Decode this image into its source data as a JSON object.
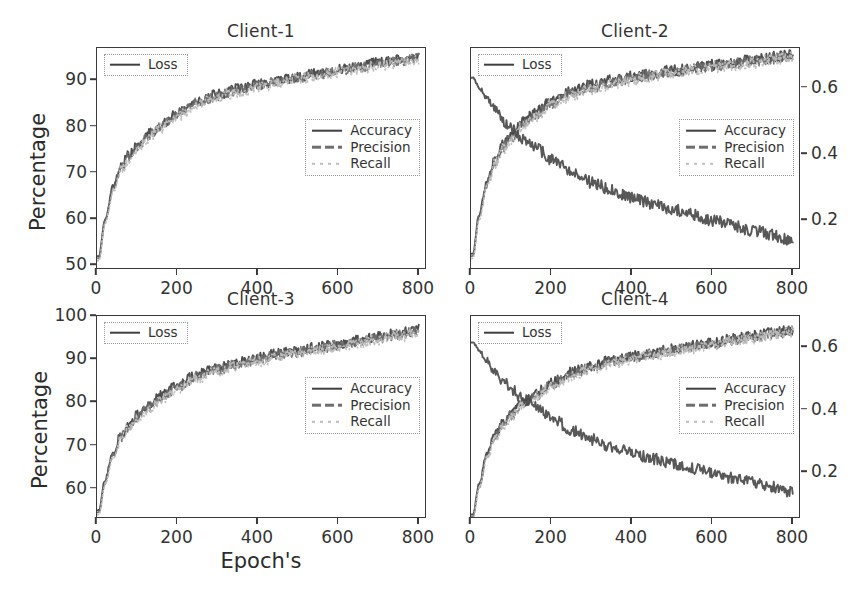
{
  "figure": {
    "xlabel": "Epoch's",
    "ylabel": "Percentage",
    "legend_loss_label": "Loss"
  },
  "legend": {
    "accuracy": "Accuracy",
    "precision": "Precision",
    "recall": "Recall",
    "loss": "Loss"
  },
  "colors": {
    "accuracy": "#3f3f3f",
    "precision": "#6e6e6e",
    "recall": "#bdbdbd",
    "loss": "#4a4a4a",
    "axis": "#3a3a3a",
    "text": "#2b2b2b",
    "background": "#ffffff"
  },
  "chart_data": [
    {
      "type": "line",
      "title": "Client-1",
      "xlabel": "Epoch's",
      "ylabel": "Percentage",
      "xlim": [
        0,
        820
      ],
      "ylim": [
        49,
        97
      ],
      "xticks": [
        0,
        200,
        400,
        600,
        800
      ],
      "yticks": [
        50,
        60,
        70,
        80,
        90
      ],
      "ylim_right": [
        0.05,
        0.72
      ],
      "yticks_right": [],
      "grid": false,
      "legend_position": "center-right",
      "series": [
        {
          "name": "Accuracy",
          "style": "solid",
          "color": "#3f3f3f",
          "x": [
            5,
            20,
            40,
            60,
            80,
            100,
            130,
            160,
            200,
            250,
            300,
            350,
            400,
            450,
            500,
            550,
            600,
            650,
            700,
            750,
            800
          ],
          "values": [
            52,
            60,
            67,
            71.5,
            74,
            76,
            78.5,
            80.5,
            83,
            85.5,
            87,
            88.2,
            89.2,
            90,
            90.8,
            91.6,
            92.4,
            93.1,
            93.8,
            94.5,
            95.2
          ],
          "noise": 1.1
        },
        {
          "name": "Precision",
          "style": "dashed",
          "color": "#6e6e6e",
          "x": [
            5,
            20,
            40,
            60,
            80,
            100,
            130,
            160,
            200,
            250,
            300,
            350,
            400,
            450,
            500,
            550,
            600,
            650,
            700,
            750,
            800
          ],
          "values": [
            51.5,
            59.5,
            66.5,
            71,
            73.6,
            75.6,
            78.1,
            80.1,
            82.6,
            85.1,
            86.6,
            87.9,
            88.9,
            89.7,
            90.5,
            91.3,
            92.1,
            92.8,
            93.5,
            94.2,
            94.9
          ],
          "noise": 1.1
        },
        {
          "name": "Recall",
          "style": "dotted",
          "color": "#bdbdbd",
          "x": [
            5,
            20,
            40,
            60,
            80,
            100,
            130,
            160,
            200,
            250,
            300,
            350,
            400,
            450,
            500,
            550,
            600,
            650,
            700,
            750,
            800
          ],
          "values": [
            51,
            59,
            66,
            70.5,
            73.2,
            75.2,
            77.7,
            79.7,
            82.2,
            84.7,
            86.2,
            87.5,
            88.5,
            89.4,
            90.2,
            91.0,
            91.8,
            92.5,
            93.2,
            93.9,
            94.6
          ],
          "noise": 1.2
        },
        {
          "name": "Loss",
          "style": "solid",
          "color": "#4a4a4a",
          "axis": "right",
          "x": [
            5,
            20,
            40,
            60,
            80,
            100,
            130,
            160,
            200,
            250,
            300,
            350,
            400,
            450,
            500,
            550,
            600,
            650,
            700,
            750,
            800
          ],
          "values": [
            92,
            90.5,
            88,
            85.5,
            83.5,
            81.5,
            79.5,
            78,
            75.5,
            72.5,
            70,
            67.5,
            65.5,
            63.5,
            62,
            60.5,
            59,
            57.5,
            56,
            54.5,
            52.5
          ],
          "noise": 1.3
        }
      ]
    },
    {
      "type": "line",
      "title": "Client-2",
      "xlabel": "Epoch's",
      "ylabel": "",
      "xlim": [
        0,
        820
      ],
      "ylim": [
        49,
        97
      ],
      "xticks": [
        0,
        200,
        400,
        600,
        800
      ],
      "yticks": [],
      "ylim_right": [
        0.05,
        0.72
      ],
      "yticks_right": [
        0.2,
        0.4,
        0.6
      ],
      "grid": false,
      "legend_position": "center-right",
      "series": [
        {
          "name": "Accuracy",
          "style": "solid",
          "color": "#3f3f3f",
          "x": [
            5,
            20,
            40,
            60,
            80,
            100,
            130,
            160,
            200,
            250,
            300,
            350,
            400,
            450,
            500,
            550,
            600,
            650,
            700,
            750,
            800
          ],
          "values": [
            52.5,
            61,
            68,
            73,
            76,
            78,
            81,
            83,
            85.5,
            87.5,
            89,
            90,
            90.8,
            91.5,
            92.1,
            92.7,
            93.3,
            93.9,
            94.4,
            95,
            95.6
          ],
          "noise": 1.2
        },
        {
          "name": "Precision",
          "style": "dashed",
          "color": "#6e6e6e",
          "x": [
            5,
            20,
            40,
            60,
            80,
            100,
            130,
            160,
            200,
            250,
            300,
            350,
            400,
            450,
            500,
            550,
            600,
            650,
            700,
            750,
            800
          ],
          "values": [
            52,
            60.5,
            67.5,
            72.5,
            75.6,
            77.6,
            80.6,
            82.6,
            85.1,
            87.1,
            88.6,
            89.6,
            90.5,
            91.2,
            91.8,
            92.4,
            93.0,
            93.6,
            94.1,
            94.7,
            95.3
          ],
          "noise": 1.2
        },
        {
          "name": "Recall",
          "style": "dotted",
          "color": "#bdbdbd",
          "x": [
            5,
            20,
            40,
            60,
            80,
            100,
            130,
            160,
            200,
            250,
            300,
            350,
            400,
            450,
            500,
            550,
            600,
            650,
            700,
            750,
            800
          ],
          "values": [
            51.5,
            60,
            67,
            72,
            75.2,
            77.2,
            80.2,
            82.2,
            84.7,
            86.7,
            88.2,
            89.2,
            90.1,
            90.9,
            91.5,
            92.1,
            92.7,
            93.3,
            93.8,
            94.4,
            95.0
          ],
          "noise": 1.3
        },
        {
          "name": "Loss",
          "style": "solid",
          "color": "#4a4a4a",
          "axis": "right",
          "x": [
            5,
            20,
            40,
            60,
            80,
            100,
            130,
            160,
            200,
            250,
            300,
            350,
            400,
            450,
            500,
            550,
            600,
            650,
            700,
            750,
            800
          ],
          "values": [
            0.63,
            0.6,
            0.565,
            0.53,
            0.5,
            0.475,
            0.445,
            0.42,
            0.385,
            0.345,
            0.315,
            0.29,
            0.27,
            0.25,
            0.235,
            0.218,
            0.2,
            0.185,
            0.17,
            0.155,
            0.14
          ],
          "noise": 0.018
        }
      ]
    },
    {
      "type": "line",
      "title": "Client-3",
      "xlabel": "Epoch's",
      "ylabel": "Percentage",
      "xlim": [
        0,
        820
      ],
      "ylim": [
        53,
        100
      ],
      "xticks": [
        0,
        200,
        400,
        600,
        800
      ],
      "yticks": [
        60,
        70,
        80,
        90,
        100
      ],
      "ylim_right": [
        0.05,
        0.72
      ],
      "yticks_right": [],
      "grid": false,
      "legend_position": "center-right",
      "series": [
        {
          "name": "Accuracy",
          "style": "solid",
          "color": "#3f3f3f",
          "x": [
            5,
            20,
            40,
            60,
            80,
            100,
            130,
            160,
            200,
            250,
            300,
            350,
            400,
            450,
            500,
            550,
            600,
            650,
            700,
            750,
            800
          ],
          "values": [
            55,
            62,
            68.5,
            72.5,
            75,
            77,
            79.5,
            81.5,
            84,
            86.5,
            88,
            89.2,
            90.3,
            91.2,
            92,
            92.8,
            93.6,
            94.4,
            95.2,
            96,
            96.8
          ],
          "noise": 1.2
        },
        {
          "name": "Precision",
          "style": "dashed",
          "color": "#6e6e6e",
          "x": [
            5,
            20,
            40,
            60,
            80,
            100,
            130,
            160,
            200,
            250,
            300,
            350,
            400,
            450,
            500,
            550,
            600,
            650,
            700,
            750,
            800
          ],
          "values": [
            54.5,
            61.5,
            68,
            72,
            74.6,
            76.6,
            79.1,
            81.1,
            83.6,
            86.1,
            87.6,
            88.9,
            90.0,
            90.9,
            91.7,
            92.5,
            93.3,
            94.1,
            94.9,
            95.7,
            96.5
          ],
          "noise": 1.2
        },
        {
          "name": "Recall",
          "style": "dotted",
          "color": "#bdbdbd",
          "x": [
            5,
            20,
            40,
            60,
            80,
            100,
            130,
            160,
            200,
            250,
            300,
            350,
            400,
            450,
            500,
            550,
            600,
            650,
            700,
            750,
            800
          ],
          "values": [
            54,
            61,
            67.5,
            71.5,
            74.2,
            76.2,
            78.7,
            80.7,
            83.2,
            85.7,
            87.2,
            88.5,
            89.6,
            90.5,
            91.3,
            92.1,
            92.9,
            93.7,
            94.5,
            95.3,
            96.1
          ],
          "noise": 1.3
        },
        {
          "name": "Loss",
          "style": "solid",
          "color": "#4a4a4a",
          "axis": "right",
          "x": [
            5,
            20,
            40,
            60,
            80,
            100,
            130,
            160,
            200,
            250,
            300,
            350,
            400,
            450,
            500,
            550,
            600,
            650,
            700,
            750,
            800
          ],
          "values": [
            94.5,
            92.5,
            90,
            87.5,
            85.5,
            83.5,
            81,
            79,
            76.5,
            73.5,
            71,
            68.5,
            66.5,
            64.5,
            62.5,
            61,
            59.5,
            58,
            56.5,
            55,
            53.5
          ],
          "noise": 1.4
        }
      ]
    },
    {
      "type": "line",
      "title": "Client-4",
      "xlabel": "Epoch's",
      "ylabel": "",
      "xlim": [
        0,
        820
      ],
      "ylim": [
        53,
        100
      ],
      "xticks": [
        0,
        200,
        400,
        600,
        800
      ],
      "yticks": [],
      "ylim_right": [
        0.05,
        0.7
      ],
      "yticks_right": [
        0.2,
        0.4,
        0.6
      ],
      "grid": false,
      "legend_position": "center-right",
      "series": [
        {
          "name": "Accuracy",
          "style": "solid",
          "color": "#3f3f3f",
          "x": [
            5,
            20,
            40,
            60,
            80,
            100,
            130,
            160,
            200,
            250,
            300,
            350,
            400,
            450,
            500,
            550,
            600,
            650,
            700,
            750,
            800
          ],
          "values": [
            54,
            61,
            68,
            72.5,
            75.5,
            77.5,
            80,
            82,
            84.5,
            87,
            88.5,
            89.7,
            90.7,
            91.5,
            92.3,
            93.1,
            93.9,
            94.7,
            95.4,
            96.1,
            96.8
          ],
          "noise": 1.2
        },
        {
          "name": "Precision",
          "style": "dashed",
          "color": "#6e6e6e",
          "x": [
            5,
            20,
            40,
            60,
            80,
            100,
            130,
            160,
            200,
            250,
            300,
            350,
            400,
            450,
            500,
            550,
            600,
            650,
            700,
            750,
            800
          ],
          "values": [
            53.5,
            60.5,
            67.5,
            72,
            75.1,
            77.1,
            79.6,
            81.6,
            84.1,
            86.6,
            88.1,
            89.4,
            90.4,
            91.2,
            92.0,
            92.8,
            93.6,
            94.4,
            95.1,
            95.8,
            96.5
          ],
          "noise": 1.2
        },
        {
          "name": "Recall",
          "style": "dotted",
          "color": "#bdbdbd",
          "x": [
            5,
            20,
            40,
            60,
            80,
            100,
            130,
            160,
            200,
            250,
            300,
            350,
            400,
            450,
            500,
            550,
            600,
            650,
            700,
            750,
            800
          ],
          "values": [
            53,
            60,
            67,
            71.5,
            74.7,
            76.7,
            79.2,
            81.2,
            83.7,
            86.2,
            87.7,
            89.0,
            90.0,
            90.9,
            91.7,
            92.5,
            93.3,
            94.1,
            94.8,
            95.5,
            96.2
          ],
          "noise": 1.3
        },
        {
          "name": "Loss",
          "style": "solid",
          "color": "#4a4a4a",
          "axis": "right",
          "x": [
            5,
            20,
            40,
            60,
            80,
            100,
            130,
            160,
            200,
            250,
            300,
            350,
            400,
            450,
            500,
            550,
            600,
            650,
            700,
            750,
            800
          ],
          "values": [
            0.615,
            0.59,
            0.555,
            0.52,
            0.49,
            0.465,
            0.435,
            0.41,
            0.375,
            0.335,
            0.305,
            0.282,
            0.262,
            0.243,
            0.227,
            0.212,
            0.196,
            0.181,
            0.167,
            0.152,
            0.135
          ],
          "noise": 0.018
        }
      ]
    }
  ]
}
